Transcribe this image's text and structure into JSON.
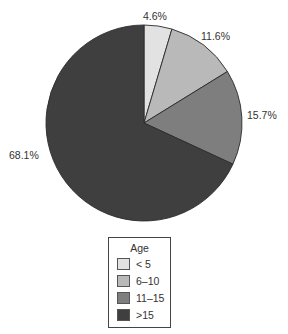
{
  "chart_data": {
    "type": "pie",
    "title": "",
    "legend_title": "Age",
    "legend_position": "bottom",
    "categories": [
      "< 5",
      "6–10",
      "11–15",
      ">15"
    ],
    "values": [
      4.6,
      11.6,
      15.7,
      68.1
    ],
    "labels": [
      "4.6%",
      "11.6%",
      "15.7%",
      "68.1%"
    ],
    "colors": [
      "#e2e2e2",
      "#b9b9b9",
      "#7e7e7e",
      "#3f3f3f"
    ],
    "start_angle": "12 o'clock",
    "direction": "clockwise"
  },
  "legend": {
    "title": "Age",
    "items": [
      {
        "label": "< 5",
        "color": "#e2e2e2"
      },
      {
        "label": "6–10",
        "color": "#b9b9b9"
      },
      {
        "label": "11–15",
        "color": "#7e7e7e"
      },
      {
        "label": ">15",
        "color": "#3f3f3f"
      }
    ]
  },
  "slice_labels": [
    "4.6%",
    "11.6%",
    "15.7%",
    "68.1%"
  ]
}
